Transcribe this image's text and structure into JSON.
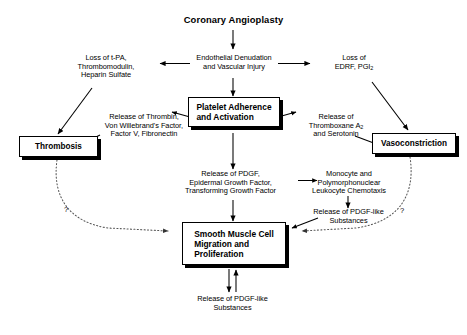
{
  "diagram": {
    "nodes": {
      "coronary_angioplasty": "Coronary Angioplasty",
      "endothelial_denudation": "Endothelial Denudation\nand Vascular Injury",
      "loss_tpa": "Loss of t-PA,\nThrombomodulin,\nHeparin Sulfate",
      "loss_edrf_line1": "Loss of",
      "loss_edrf_line2_pre": "EDRF, PGI",
      "loss_edrf_sub": "2",
      "platelet_adherence": "Platelet Adherence\nand Activation",
      "release_thrombin": "Release of Thrombin,\nVon Willebrand's Factor,\nFactor V, Fibronectin",
      "release_thromboxane_line1": "Release of",
      "release_thromboxane_line2_pre": "Thromboxane A",
      "release_thromboxane_sub": "2",
      "release_thromboxane_line3": "and Serotonin",
      "thrombosis": "Thrombosis",
      "vasoconstriction": "Vasoconstriction",
      "release_pdgf_growth": "Release of PDGF,\nEpidermal Growth Factor,\nTransforming Growth Factor",
      "monocyte_chemotaxis": "Monocyte and\nPolymorphonuclear\nLeukocyte Chemotaxis",
      "release_pdgf_like_right": "Release of PDGF-like\nSubstances",
      "smooth_muscle_cell": "Smooth Muscle Cell\nMigration and\nProliferation",
      "release_pdgf_like_bottom": "Release of PDGF-like\nSubstances"
    },
    "annotations": {
      "question_left": "?",
      "question_right": "?"
    },
    "colors": {
      "stroke": "#000000",
      "text": "#000000",
      "background": "#ffffff",
      "dotted": "#555555"
    }
  }
}
